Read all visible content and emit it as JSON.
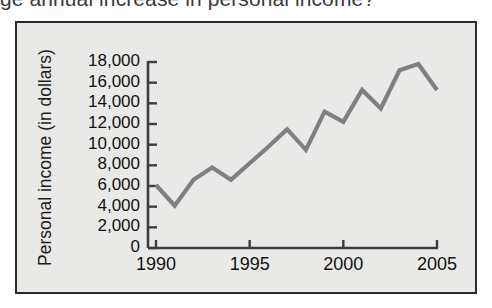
{
  "page": {
    "question_text": "ge annual increase in personal income?",
    "background_color": "#ffffff"
  },
  "figure": {
    "border_color": "#2b2b2b",
    "plot_background_color": "#e9e9e7",
    "line_color": "#808080",
    "axis_color": "#3d3d3d"
  },
  "chart_data": {
    "type": "line",
    "title": "",
    "xlabel": "",
    "ylabel": "Personal income (in dollars)",
    "xlim": [
      1990,
      2005
    ],
    "ylim": [
      0,
      18000
    ],
    "grid": false,
    "legend": "none",
    "x_tick_labels": [
      "1990",
      "1995",
      "2000",
      "2005"
    ],
    "x_tick_values": [
      1990,
      1995,
      2000,
      2005
    ],
    "y_tick_labels": [
      "18,000",
      "16,000",
      "14,000",
      "12,000",
      "10,000",
      "8,000",
      "6,000",
      "4,000",
      "2,000",
      "0"
    ],
    "y_tick_values": [
      18000,
      16000,
      14000,
      12000,
      10000,
      8000,
      6000,
      4000,
      2000,
      0
    ],
    "x": [
      1990,
      1991,
      1992,
      1993,
      1994,
      1995,
      1996,
      1997,
      1998,
      1999,
      2000,
      2001,
      2002,
      2003,
      2004,
      2005
    ],
    "values": [
      6100,
      4100,
      6600,
      7800,
      6600,
      8200,
      9800,
      11500,
      9500,
      13200,
      12200,
      15300,
      13500,
      17200,
      17800,
      15300
    ],
    "series": [
      {
        "name": "Personal income",
        "values": [
          6100,
          4100,
          6600,
          7800,
          6600,
          8200,
          9800,
          11500,
          9500,
          13200,
          12200,
          15300,
          13500,
          17200,
          17800,
          15300
        ]
      }
    ]
  }
}
